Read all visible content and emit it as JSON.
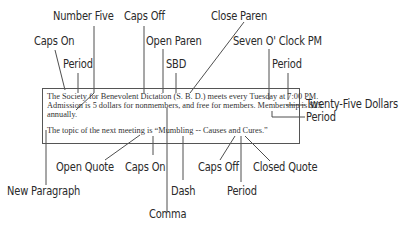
{
  "document": {
    "line1": "The Society for Benevolent Dictation (S. B. D.) meets every Tuesday at 7:00 PM.",
    "line2": "Admission is 5 dollars for nonmembers, and free for members. Membership is $25",
    "line3": "annually.",
    "line4": "The topic of the next meeting is “Mumbling -- Causes and Cures.”"
  },
  "callouts": {
    "number_five": "Number Five",
    "caps_off_top": "Caps Off",
    "close_paren": "Close Paren",
    "caps_on_top": "Caps On",
    "open_paren": "Open Paren",
    "seven_oclock": "Seven O' Clock PM",
    "period_top_left": "Period",
    "sbd": "SBD",
    "period_top_right": "Period",
    "twenty_five_dollars": "Twenty-Five Dollars",
    "period_right": "Period",
    "open_quote": "Open Quote",
    "caps_on_bottom": "Caps On",
    "caps_off_bottom": "Caps Off",
    "closed_quote": "Closed Quote",
    "new_paragraph": "New Paragraph",
    "dash": "Dash",
    "period_bottom": "Period",
    "comma": "Comma"
  },
  "colors": {
    "line": "#3a3a3a",
    "text": "#2a2a2a"
  }
}
